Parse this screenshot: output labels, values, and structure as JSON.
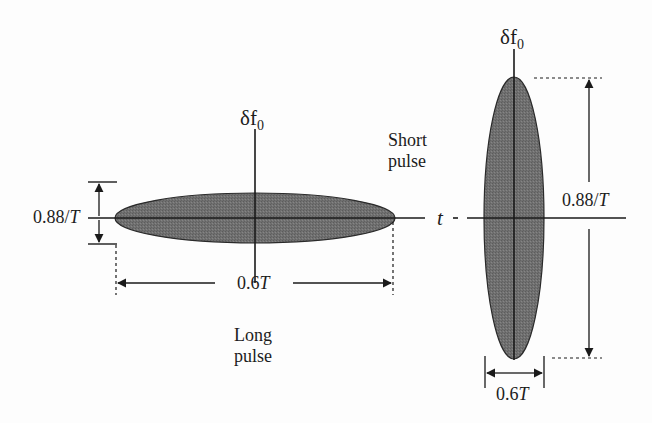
{
  "diagram": {
    "type": "time-frequency uncertainty ellipses",
    "long_pulse": {
      "caption_line1": "Long",
      "caption_line2": "pulse",
      "freq_axis_label": "δf",
      "freq_axis_subscript": "0",
      "time_axis_label": "t",
      "freq_extent_label": "0.88/",
      "freq_extent_var": "T",
      "time_extent_label": "0.6",
      "time_extent_var": "T"
    },
    "short_pulse": {
      "caption_line1": "Short",
      "caption_line2": "pulse",
      "freq_axis_label": "δf",
      "freq_axis_subscript": "0",
      "freq_extent_label": "0.88/",
      "freq_extent_var": "T",
      "time_extent_label": "0.6",
      "time_extent_var": "T"
    },
    "colors": {
      "ellipse_fill": "#6e6e6e",
      "line": "#1a1a1a",
      "background": "#fdfdfd"
    }
  }
}
